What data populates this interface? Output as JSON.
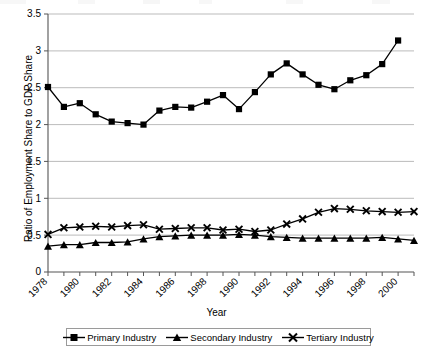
{
  "chart_data": {
    "type": "line",
    "title": "",
    "xlabel": "Year",
    "ylabel": "Ratio of Employment Share to GDP Share",
    "x": [
      1978,
      1979,
      1980,
      1981,
      1982,
      1983,
      1984,
      1985,
      1986,
      1987,
      1988,
      1989,
      1990,
      1991,
      1992,
      1993,
      1994,
      1995,
      1996,
      1997,
      1998,
      1999,
      2000,
      2001
    ],
    "xlim": [
      1978,
      2001
    ],
    "ylim": [
      0,
      3.5
    ],
    "ytick_labels": [
      "0",
      "0.5",
      "1",
      "1.5",
      "2",
      "2.5",
      "3",
      "3.5"
    ],
    "ytick_values": [
      0,
      0.5,
      1,
      1.5,
      2,
      2.5,
      3,
      3.5
    ],
    "xtick_labels": [
      "1978",
      "1980",
      "1982",
      "1984",
      "1986",
      "1988",
      "1990",
      "1992",
      "1994",
      "1996",
      "1998",
      "2000"
    ],
    "xtick_values": [
      1978,
      1980,
      1982,
      1984,
      1986,
      1988,
      1990,
      1992,
      1994,
      1996,
      1998,
      2000
    ],
    "grid": "horizontal",
    "legend_position": "bottom",
    "series": [
      {
        "name": "Primary Industry",
        "marker": "square",
        "color": "#000000",
        "values": [
          2.51,
          2.24,
          2.29,
          2.14,
          2.04,
          2.02,
          2.0,
          2.19,
          2.24,
          2.23,
          2.31,
          2.4,
          2.21,
          2.44,
          2.68,
          2.83,
          2.68,
          2.54,
          2.48,
          2.6,
          2.67,
          2.82,
          3.14,
          null
        ]
      },
      {
        "name": "Secondary Industry",
        "marker": "triangle",
        "color": "#000000",
        "values": [
          0.35,
          0.37,
          0.37,
          0.4,
          0.4,
          0.41,
          0.45,
          0.48,
          0.49,
          0.5,
          0.5,
          0.5,
          0.51,
          0.5,
          0.48,
          0.47,
          0.46,
          0.46,
          0.46,
          0.46,
          0.46,
          0.47,
          0.45,
          0.43
        ]
      },
      {
        "name": "Tertiary Industry",
        "marker": "x",
        "color": "#000000",
        "values": [
          0.51,
          0.6,
          0.61,
          0.62,
          0.61,
          0.63,
          0.64,
          0.58,
          0.59,
          0.6,
          0.6,
          0.57,
          0.58,
          0.55,
          0.57,
          0.65,
          0.72,
          0.81,
          0.86,
          0.85,
          0.83,
          0.82,
          0.81,
          0.82
        ]
      }
    ]
  },
  "axes": {
    "y_axis_title": "Ratio of Employment Share to GDP Share",
    "x_axis_title": "Year"
  },
  "legend": {
    "items": [
      {
        "label": "Primary Industry",
        "marker": "square"
      },
      {
        "label": "Secondary Industry",
        "marker": "triangle"
      },
      {
        "label": "Tertiary Industry",
        "marker": "x"
      }
    ]
  }
}
